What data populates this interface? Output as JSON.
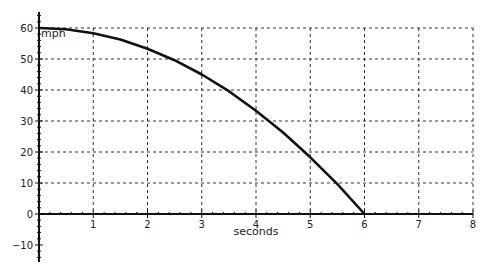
{
  "chart_data": {
    "type": "line",
    "title": "",
    "xlabel": "seconds",
    "ylabel": "mph",
    "xlim": [
      0,
      8
    ],
    "ylim": [
      -15,
      65
    ],
    "x_ticks": [
      1,
      2,
      3,
      4,
      5,
      6,
      7,
      8
    ],
    "y_ticks": [
      -10,
      0,
      10,
      20,
      30,
      40,
      50,
      60
    ],
    "grid": true,
    "grid_style": "dashed",
    "legend": null,
    "series": [
      {
        "name": "speed",
        "color": "#111111",
        "x": [
          0,
          0.5,
          1,
          1.5,
          2,
          2.5,
          3,
          3.5,
          4,
          4.5,
          5,
          5.5,
          6
        ],
        "y": [
          60,
          59.6,
          58.3,
          56.3,
          53.3,
          49.6,
          45,
          39.6,
          33.3,
          26.3,
          18.3,
          9.6,
          0
        ]
      }
    ]
  }
}
